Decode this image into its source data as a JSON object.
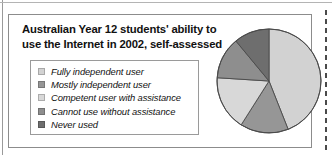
{
  "figure": {
    "title_line1": "Australian Year 12 students' ability to",
    "title_line2": "use the Internet in 2002, self-assessed"
  },
  "legend": {
    "items": [
      {
        "label": "Fully independent user",
        "color": "#d2d2d2",
        "swatch_name": "legend-swatch-fully-independent-user"
      },
      {
        "label": "Mostly independent user",
        "color": "#969696",
        "swatch_name": "legend-swatch-mostly-independent-user"
      },
      {
        "label": "Competent user with assistance",
        "color": "#d8d8d8",
        "swatch_name": "legend-swatch-competent-user-with-assistance"
      },
      {
        "label": "Cannot use without assistance",
        "color": "#8e8e8e",
        "swatch_name": "legend-swatch-cannot-use-without-assistance"
      },
      {
        "label": "Never used",
        "color": "#6e6e6e",
        "swatch_name": "legend-swatch-never-used"
      }
    ]
  },
  "chart_data": {
    "type": "pie",
    "title": "Australian Year 12 students' ability to use the Internet in 2002, self-assessed",
    "xlabel": "",
    "ylabel": "",
    "unit": "percent",
    "start_angle": 0,
    "direction": "clockwise",
    "legend_position": "left",
    "grid": false,
    "categories": [
      "Fully independent user",
      "Mostly independent user",
      "Competent user with assistance",
      "Cannot use without assistance",
      "Never used"
    ],
    "values": [
      44,
      15,
      17,
      13,
      11
    ],
    "colors": [
      "#d2d2d2",
      "#969696",
      "#d8d8d8",
      "#8e8e8e",
      "#6e6e6e"
    ],
    "slice_edge_color": "#4a4a4a",
    "center": {
      "x": 54,
      "y": 56
    },
    "radius": 52
  }
}
